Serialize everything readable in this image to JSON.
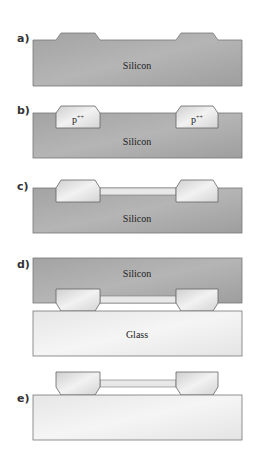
{
  "figure": {
    "steps": [
      {
        "id": "a",
        "label": "a)",
        "substrate_label": "Silicon"
      },
      {
        "id": "b",
        "label": "b)",
        "substrate_label": "Silicon",
        "doped_label_left": "p++",
        "doped_label_right": "p++"
      },
      {
        "id": "c",
        "label": "c)",
        "substrate_label": "Silicon"
      },
      {
        "id": "d",
        "label": "d)",
        "substrate_label": "Silicon",
        "bottom_label": "Glass"
      },
      {
        "id": "e",
        "label": "e)"
      }
    ],
    "colors": {
      "silicon": "#a9a9a9",
      "silicon_dark": "#989898",
      "p_doped": "#dcdcdc",
      "membrane": "#e6e6e6",
      "glass": "#ededed",
      "outline": "#666666"
    }
  }
}
